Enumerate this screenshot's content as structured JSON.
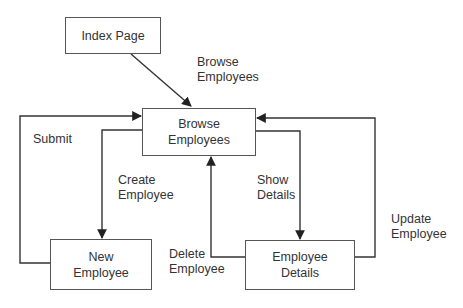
{
  "nodes": {
    "index_page": "Index Page",
    "browse_employees": "Browse\nEmployees",
    "new_employee": "New\nEmployee",
    "employee_details": "Employee\nDetails"
  },
  "edges": {
    "browse_employees": "Browse\nEmployees",
    "submit": "Submit",
    "create_employee": "Create\nEmployee",
    "show_details": "Show\nDetails",
    "delete_employee": "Delete\nEmployee",
    "update_employee": "Update\nEmployee"
  },
  "colors": {
    "line": "#333333",
    "border": "#555555"
  }
}
